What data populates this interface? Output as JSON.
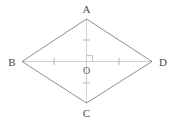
{
  "figure": {
    "kind": "rhombus-with-diagonals",
    "width": 175,
    "height": 124,
    "background_color": "#ffffff",
    "outline_color": "#8d8d8d",
    "diagonal_color": "#cfcfcf",
    "tick_color": "#b5b5b5",
    "right_angle_color": "#c4c4c4",
    "label_color": "#4a4a4a",
    "center_label_color": "#5a5a5a",
    "outline_width": 1,
    "diagonal_width": 1,
    "vertices": {
      "A": {
        "label": "A",
        "x": 86.5,
        "y": 19
      },
      "B": {
        "label": "B",
        "x": 22,
        "y": 61.5
      },
      "C": {
        "label": "C",
        "x": 86.5,
        "y": 103
      },
      "D": {
        "label": "D",
        "x": 152,
        "y": 61.5
      },
      "O": {
        "label": "O",
        "x": 86.5,
        "y": 61.5
      }
    },
    "labels": {
      "A": {
        "text": "A",
        "x": 86.5,
        "y": 13
      },
      "B": {
        "text": "B",
        "x": 12,
        "y": 65
      },
      "C": {
        "text": "C",
        "x": 86.5,
        "y": 116
      },
      "D": {
        "text": "D",
        "x": 163,
        "y": 65
      },
      "O": {
        "text": "O",
        "x": 86.5,
        "y": 74
      }
    },
    "edges": [
      {
        "name": "AB",
        "from": "A",
        "to": "B"
      },
      {
        "name": "BC",
        "from": "B",
        "to": "C"
      },
      {
        "name": "CD",
        "from": "C",
        "to": "D"
      },
      {
        "name": "DA",
        "from": "D",
        "to": "A"
      }
    ],
    "diagonals": [
      {
        "name": "AC",
        "from": "A",
        "to": "C"
      },
      {
        "name": "BD",
        "from": "B",
        "to": "D"
      }
    ],
    "ticks": [
      {
        "name": "tick-AO",
        "on": "AC",
        "x": 86.5,
        "y": 40,
        "orientation": "horizontal",
        "length": 7
      },
      {
        "name": "tick-OC",
        "on": "AC",
        "x": 86.5,
        "y": 83,
        "orientation": "horizontal",
        "length": 7
      },
      {
        "name": "tick-BO",
        "on": "BD",
        "x": 54,
        "y": 61.5,
        "orientation": "vertical",
        "length": 7
      },
      {
        "name": "tick-OD",
        "on": "BD",
        "x": 119,
        "y": 61.5,
        "orientation": "vertical",
        "length": 7
      }
    ],
    "right_angle_marker": {
      "name": "right-angle-at-O",
      "x": 86.5,
      "y": 61.5,
      "size": 6
    }
  }
}
